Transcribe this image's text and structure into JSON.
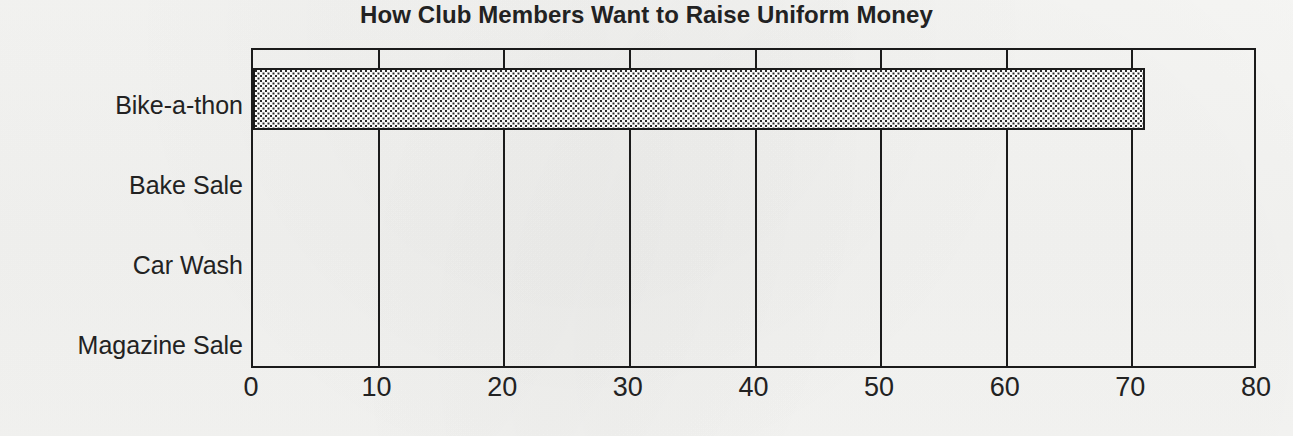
{
  "chart_data": {
    "type": "bar",
    "orientation": "horizontal",
    "title": "How Club Members Want to Raise Uniform Money",
    "xlabel": "",
    "ylabel": "",
    "categories": [
      "Bike-a-thon",
      "Bake Sale",
      "Car Wash",
      "Magazine Sale"
    ],
    "values": [
      71,
      0,
      0,
      0
    ],
    "xlim": [
      0,
      80
    ],
    "xticks": [
      0,
      10,
      20,
      30,
      40,
      50,
      60,
      70,
      80
    ],
    "xtick_labels": [
      "0",
      "10",
      "20",
      "30",
      "40",
      "50",
      "60",
      "70",
      "80"
    ],
    "grid": "vertical",
    "legend": null,
    "series": [
      {
        "name": "Members",
        "values": [
          71,
          0,
          0,
          0
        ]
      }
    ],
    "style": {
      "bar_fill": "dotted-checker-pattern",
      "bar_edge_color": "#1b1b1b",
      "frame_color": "#1b1b1b",
      "gridline_color": "#1b1b1b",
      "background": "#f4f4f2",
      "text_color": "#222222"
    }
  }
}
